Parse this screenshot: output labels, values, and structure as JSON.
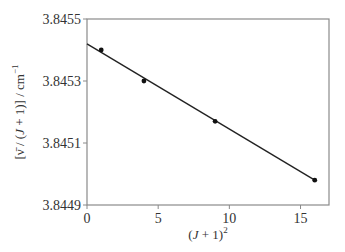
{
  "chart_data": {
    "type": "scatter",
    "title": "",
    "xlabel": "(J + 1)²",
    "ylabel": "[ν̄ / (J + 1)] / cm⁻¹",
    "xlim": [
      0,
      17
    ],
    "ylim": [
      3.8449,
      3.8455
    ],
    "x_ticks": [
      0,
      5,
      10,
      15
    ],
    "x_tick_labels": [
      "0",
      "5",
      "10",
      "15"
    ],
    "y_ticks": [
      3.8449,
      3.8451,
      3.8453,
      3.8455
    ],
    "y_tick_labels": [
      "3.8449",
      "3.8451",
      "3.8453",
      "3.8455"
    ],
    "grid": false,
    "legend": null,
    "series": [
      {
        "name": "data",
        "kind": "points",
        "x": [
          1,
          4,
          9,
          16
        ],
        "y": [
          3.8454,
          3.8453,
          3.84517,
          3.84498
        ]
      },
      {
        "name": "linear fit",
        "kind": "line",
        "x": [
          0,
          16
        ],
        "y": [
          3.84542,
          3.84498
        ]
      }
    ],
    "colors": {
      "frame": "#888888",
      "line": "#222222",
      "points": "#111111"
    }
  },
  "labels": {
    "x_axis": {
      "open": "(",
      "var": "J",
      "mid": " + 1)",
      "sup": "2"
    },
    "y_axis": {
      "prefix": "[",
      "nu_bar": "ν̄",
      "slash1": " / (",
      "var": "J",
      "mid": " + 1)] / cm",
      "sup": "−1"
    }
  }
}
